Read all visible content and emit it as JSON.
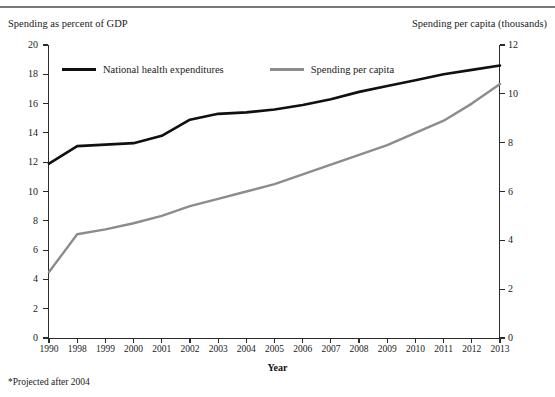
{
  "header": {
    "cropped_title": "",
    "left_axis_caption": "Spending as percent of GDP",
    "right_axis_caption": "Spending per capita (thousands)"
  },
  "legend": {
    "items": [
      {
        "label": "National health expenditures",
        "color": "#101010"
      },
      {
        "label": "Spending per capita",
        "color": "#8c8c8c"
      }
    ]
  },
  "footnote": "*Projected after 2004",
  "chart_data": {
    "type": "line",
    "title": "",
    "xlabel": "Year",
    "ylabel": "Spending as percent of GDP",
    "y2label": "Spending per capita (thousands)",
    "categories": [
      "1990",
      "1998",
      "1999",
      "2000",
      "2001",
      "2002",
      "2003",
      "2004",
      "2005",
      "2006",
      "2007",
      "2008",
      "2009",
      "2010",
      "2011",
      "2012",
      "2013"
    ],
    "ylim": [
      0,
      20
    ],
    "yticks": [
      0,
      2,
      4,
      6,
      8,
      10,
      12,
      14,
      16,
      18,
      20
    ],
    "y2lim": [
      0,
      12
    ],
    "y2ticks": [
      0,
      2,
      4,
      6,
      8,
      10,
      12
    ],
    "grid": false,
    "legend_position": "top-left-inside",
    "series": [
      {
        "name": "National health expenditures",
        "axis": "left",
        "color": "#101010",
        "values": [
          11.9,
          13.1,
          13.2,
          13.3,
          13.8,
          14.9,
          15.3,
          15.4,
          15.6,
          15.9,
          16.3,
          16.8,
          17.2,
          17.6,
          18.0,
          18.3,
          18.6
        ]
      },
      {
        "name": "Spending per capita",
        "axis": "right",
        "color": "#8c8c8c",
        "values": [
          2.7,
          4.25,
          4.45,
          4.7,
          5.0,
          5.4,
          5.7,
          6.0,
          6.3,
          6.7,
          7.1,
          7.5,
          7.9,
          8.4,
          8.9,
          9.6,
          10.4
        ]
      }
    ]
  }
}
